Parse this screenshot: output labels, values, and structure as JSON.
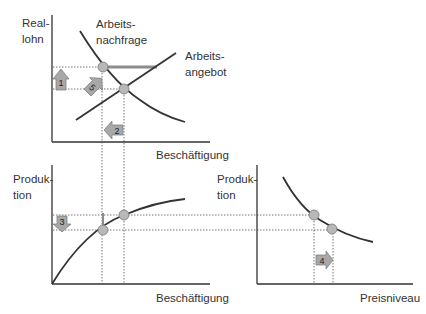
{
  "diagram": {
    "top_chart": {
      "y_label_line1": "Real-",
      "y_label_line2": "lohn",
      "x_label": "Beschäftigung",
      "demand_label_line1": "Arbeits-",
      "demand_label_line2": "nachfrage",
      "supply_label_line1": "Arbeits-",
      "supply_label_line2": "angebot"
    },
    "bottom_left_chart": {
      "y_label_line1": "Produk-",
      "y_label_line2": "tion",
      "x_label": "Beschäftigung"
    },
    "bottom_right_chart": {
      "y_label_line1": "Produk-",
      "y_label_line2": "tion",
      "x_label": "Preisniveau"
    },
    "arrows": [
      {
        "id": "1",
        "label": "1",
        "direction": "up"
      },
      {
        "id": "2",
        "label": "2",
        "direction": "left"
      },
      {
        "id": "3",
        "label": "3",
        "direction": "down"
      },
      {
        "id": "4",
        "label": "4",
        "direction": "right"
      },
      {
        "id": "5",
        "label": "5",
        "direction": "down-right"
      }
    ],
    "colors": {
      "curve": "#333333",
      "point_fill": "#b8b8b8",
      "arrow_fill": "#a8a8a8",
      "dotted": "#555555",
      "gap_bar": "#8c8c8c"
    }
  }
}
